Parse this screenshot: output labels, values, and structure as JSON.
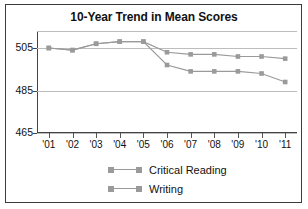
{
  "chart_data": {
    "type": "line",
    "title": "10-Year Trend in Mean Scores",
    "xlabel": "",
    "ylabel": "",
    "categories": [
      "'01",
      "'02",
      "'03",
      "'04",
      "'05",
      "'06",
      "'07",
      "'08",
      "'09",
      "'10",
      "'11"
    ],
    "ylim": [
      465,
      513
    ],
    "yticks": [
      465,
      485,
      505
    ],
    "ytick_labels": [
      "465",
      "485",
      "505"
    ],
    "grid": true,
    "legend_position": "bottom-center",
    "series": [
      {
        "name": "Critical Reading",
        "color": "#9a9a9a",
        "marker": "square",
        "values": [
          505,
          504,
          507,
          508,
          508,
          503,
          502,
          502,
          501,
          501,
          500
        ]
      },
      {
        "name": "Writing",
        "color": "#9a9a9a",
        "marker": "square",
        "values": [
          505,
          504,
          507,
          508,
          508,
          497,
          494,
          494,
          494,
          493,
          489
        ]
      }
    ]
  },
  "legend": {
    "items": [
      {
        "label": "Critical Reading"
      },
      {
        "label": "Writing"
      }
    ]
  },
  "colors": {
    "series": "#9a9a9a",
    "grid": "#bdbdbd",
    "axis": "#444444",
    "text": "#111111",
    "border": "#3c3c3c",
    "background": "#ffffff"
  }
}
